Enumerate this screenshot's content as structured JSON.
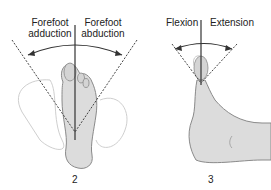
{
  "panels": [
    {
      "id": "2",
      "number": "2",
      "labels": {
        "left_line1": "Forefoot",
        "left_line2": "adduction",
        "right_line1": "Forefoot",
        "right_line2": "abduction"
      }
    },
    {
      "id": "3",
      "number": "3",
      "labels": {
        "left": "Flexion",
        "right": "Extension"
      }
    }
  ],
  "colors": {
    "skin_fill": "#dcdcdc",
    "skin_outline": "#8a8a8a",
    "line": "#333333"
  }
}
